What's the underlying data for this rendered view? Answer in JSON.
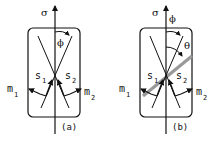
{
  "figure": {
    "panels": [
      {
        "id": "a",
        "caption": "(a)",
        "axis_label": "σ",
        "angle_label": "ϕ",
        "slip_labels": [
          "s",
          "s"
        ],
        "slip_subscripts": [
          "1",
          "2"
        ],
        "normal_labels": [
          "m",
          "m"
        ],
        "normal_subscripts": [
          "1",
          "2"
        ]
      },
      {
        "id": "b",
        "caption": "(b)",
        "axis_label": "σ",
        "angle_label": "ϕ",
        "extra_angle_label": "θ",
        "slip_labels": [
          "s",
          "s"
        ],
        "slip_subscripts": [
          "1",
          "2"
        ],
        "normal_labels": [
          "m",
          "m"
        ],
        "normal_subscripts": [
          "1",
          "2"
        ]
      }
    ],
    "colors": {
      "line": "#111111",
      "plane": "#999999",
      "background": "#ffffff"
    }
  }
}
